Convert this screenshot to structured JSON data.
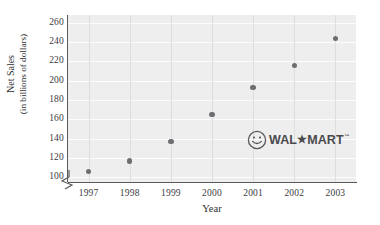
{
  "chart_data": {
    "type": "scatter",
    "title": "",
    "xlabel": "Year",
    "ylabel": "Net Sales",
    "ylabel_line2": "(in billions of dollars)",
    "categories": [
      "1997",
      "1998",
      "1999",
      "2000",
      "2001",
      "2002",
      "2003"
    ],
    "x": [
      1997,
      1998,
      1999,
      2000,
      2001,
      2002,
      2003
    ],
    "values": [
      106,
      117,
      137,
      165,
      193,
      216,
      244
    ],
    "series": [
      {
        "name": "Net Sales",
        "values": [
          106,
          117,
          137,
          165,
          193,
          216,
          244
        ]
      }
    ],
    "ylim": [
      95,
      268
    ],
    "xlim": [
      1996.5,
      2003.5
    ],
    "yticks": [
      100,
      120,
      140,
      160,
      180,
      200,
      220,
      240,
      260
    ],
    "ytick_labels": [
      "100",
      "120",
      "140",
      "160",
      "180",
      "200",
      "220",
      "240",
      "260"
    ],
    "xticks": [
      1997,
      1998,
      1999,
      2000,
      2001,
      2002,
      2003
    ],
    "xtick_labels": [
      "1997",
      "1998",
      "1999",
      "2000",
      "2001",
      "2002",
      "2003"
    ],
    "grid": true,
    "grid_orientation": "both",
    "legend": false,
    "axis_break": true,
    "marker_color": "#6e6e72",
    "plot_background": "#eeeeee",
    "gridline_color_horizontal": "#fdfdfd",
    "gridline_color_vertical": "#dedede",
    "axis_color": "#58585a",
    "annotations": [
      {
        "name": "walmart-logo",
        "text": "WAL",
        "star": "★",
        "text2": "MART",
        "trademark": "™",
        "icon": "smiley-face-icon"
      }
    ]
  }
}
